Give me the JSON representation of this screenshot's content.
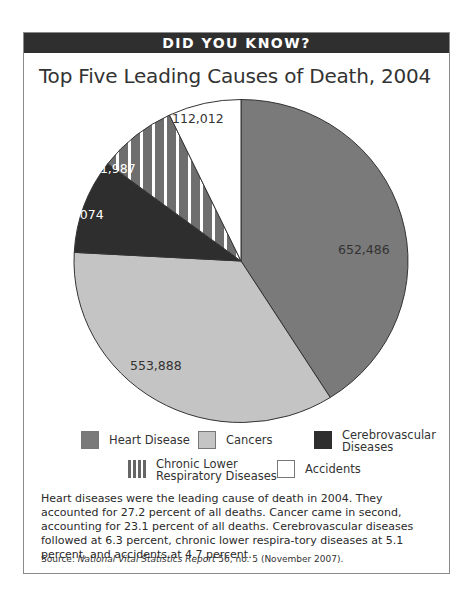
{
  "banner": {
    "text": "DID YOU KNOW?"
  },
  "title": "Top Five Leading Causes of Death, 2004",
  "colors": {
    "banner_bg": "#2f2f2f",
    "heart_disease": "#7a7a7a",
    "cancers": "#c4c4c4",
    "cerebrovascular": "#2e2e2e",
    "chronic_lower_respiratory": "#6e6e6e",
    "accidents": "#ffffff"
  },
  "chart_data": {
    "type": "pie",
    "title": "Top Five Leading Causes of Death, 2004",
    "categories": [
      "Heart Disease",
      "Cancers",
      "Cerebrovascular Diseases",
      "Chronic Lower Respiratory Diseases",
      "Accidents"
    ],
    "values": [
      652486,
      553888,
      150074,
      121987,
      112012
    ],
    "value_labels": [
      "652,486",
      "553,888",
      "150,074",
      "121,987",
      "112,012"
    ],
    "start_angle_deg": 0,
    "direction": "clockwise",
    "legend_position": "bottom"
  },
  "legend": {
    "items": [
      {
        "label_line1": "Heart Disease",
        "label_line2": ""
      },
      {
        "label_line1": "Cancers",
        "label_line2": ""
      },
      {
        "label_line1": "Cerebrovascular",
        "label_line2": "Diseases"
      },
      {
        "label_line1": "Chronic Lower",
        "label_line2": "Respiratory Diseases"
      },
      {
        "label_line1": "Accidents",
        "label_line2": ""
      }
    ]
  },
  "caption": "Heart diseases were the leading cause of death in 2004. They accounted for 27.2 percent of all deaths. Cancer came in second, accounting for 23.1 percent of all deaths. Cerebrovascular diseases followed at 6.3 percent, chronic lower respira-tory diseases at 5.1 percent, and accidents at 4.7 percent.",
  "source": {
    "prefix": "Source: ",
    "publication": "National Vital Statistics Report",
    "suffix": " 56, no. 5 (November 2007)."
  }
}
